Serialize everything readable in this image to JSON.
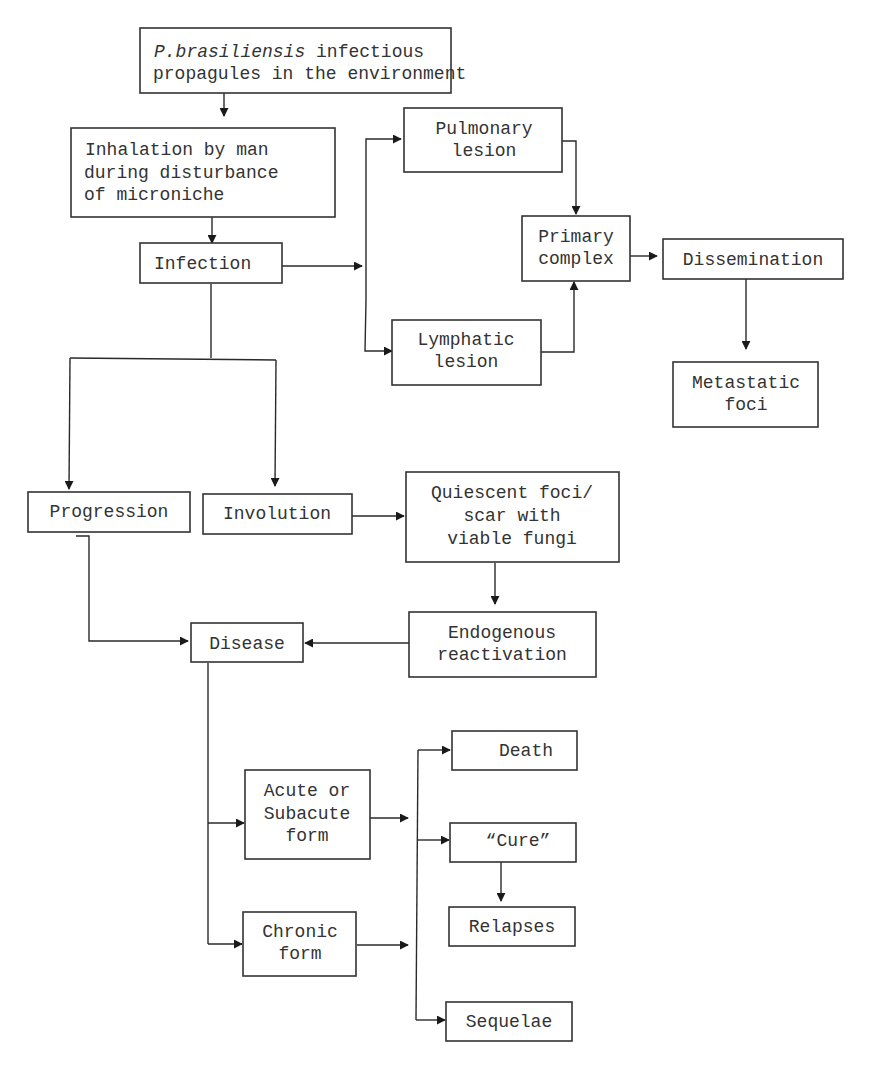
{
  "diagram": {
    "type": "flowchart",
    "nodes": {
      "propagules": {
        "lines": [
          "P.brasiliensis infectious",
          "propagules in the environment"
        ],
        "italic_prefix": "P.brasiliensis",
        "rest_first_line": " infectious"
      },
      "inhalation": {
        "lines": [
          "Inhalation by man",
          "during disturbance",
          "of microniche"
        ]
      },
      "infection": {
        "lines": [
          "Infection"
        ]
      },
      "pulmonary": {
        "lines": [
          "Pulmonary",
          "lesion"
        ]
      },
      "lymphatic": {
        "lines": [
          "Lymphatic",
          "lesion"
        ]
      },
      "primary": {
        "lines": [
          "Primary",
          "complex"
        ]
      },
      "dissemination": {
        "lines": [
          "Dissemination"
        ]
      },
      "metastatic": {
        "lines": [
          "Metastatic",
          "foci"
        ]
      },
      "progression": {
        "lines": [
          "Progression"
        ]
      },
      "involution": {
        "lines": [
          "Involution"
        ]
      },
      "quiescent": {
        "lines": [
          "Quiescent foci/",
          "scar with",
          "viable fungi"
        ]
      },
      "endogenous": {
        "lines": [
          "Endogenous",
          "reactivation"
        ]
      },
      "disease": {
        "lines": [
          "Disease"
        ]
      },
      "acute": {
        "lines": [
          "Acute or",
          "Subacute",
          "form"
        ]
      },
      "chronic": {
        "lines": [
          "Chronic",
          "form"
        ]
      },
      "death": {
        "lines": [
          "Death"
        ]
      },
      "cure": {
        "lines": [
          "“Cure”"
        ]
      },
      "relapses": {
        "lines": [
          "Relapses"
        ]
      },
      "sequelae": {
        "lines": [
          "Sequelae"
        ]
      }
    },
    "edges": [
      [
        "propagules",
        "inhalation"
      ],
      [
        "inhalation",
        "infection"
      ],
      [
        "infection",
        "pulmonary"
      ],
      [
        "infection",
        "lymphatic"
      ],
      [
        "pulmonary",
        "primary"
      ],
      [
        "lymphatic",
        "primary"
      ],
      [
        "primary",
        "dissemination"
      ],
      [
        "dissemination",
        "metastatic"
      ],
      [
        "infection",
        "progression"
      ],
      [
        "infection",
        "involution"
      ],
      [
        "involution",
        "quiescent"
      ],
      [
        "quiescent",
        "endogenous"
      ],
      [
        "endogenous",
        "disease"
      ],
      [
        "progression",
        "disease"
      ],
      [
        "disease",
        "acute"
      ],
      [
        "disease",
        "chronic"
      ],
      [
        "acute",
        "death"
      ],
      [
        "acute",
        "cure"
      ],
      [
        "acute",
        "sequelae"
      ],
      [
        "chronic",
        "death"
      ],
      [
        "chronic",
        "cure"
      ],
      [
        "chronic",
        "sequelae"
      ],
      [
        "cure",
        "relapses"
      ]
    ]
  }
}
